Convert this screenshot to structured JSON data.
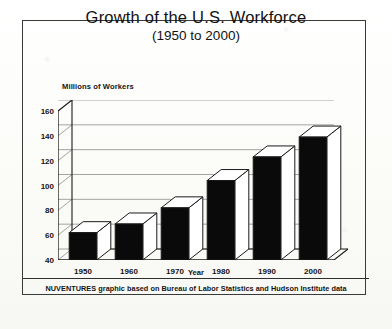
{
  "chart_data": {
    "type": "bar",
    "title": "Growth of the U.S. Workforce",
    "subtitle": "(1950 to 2000)",
    "xlabel": "Year",
    "ylabel": "Millions of Workers",
    "categories": [
      "1950",
      "1960",
      "1970",
      "1980",
      "1990",
      "2000"
    ],
    "values": [
      62,
      69,
      82,
      104,
      123,
      139
    ],
    "ylim": [
      40,
      160
    ],
    "yticks": [
      40,
      60,
      80,
      100,
      120,
      140,
      160
    ],
    "grid": true,
    "legend": "none",
    "style": "3d-block-bars",
    "bar_face_color": "#0a0a0a",
    "bar_top_color": "#ffffff",
    "outline_color": "#1a1a1a",
    "source_note": "NUVENTURES graphic based on Bureau of Labor Statistics and Hudson Institute data"
  },
  "colors": {
    "frame": "#3a3a3a",
    "text": "#121212",
    "gridline": "#8d8d8d",
    "paper": "#fdfdfb"
  }
}
